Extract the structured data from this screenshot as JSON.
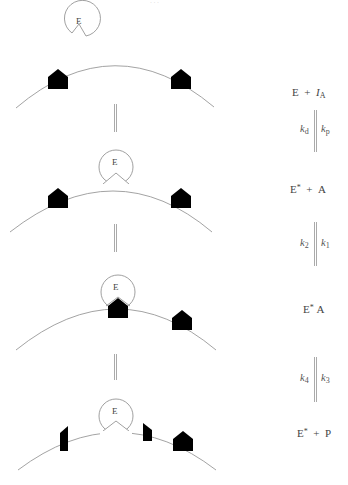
{
  "figure": {
    "type": "enzyme-mechanism-scheme",
    "header_clipped_text": "· · ·",
    "enzyme_label": "E",
    "colors": {
      "membrane": "#999999",
      "enzyme_outline": "#888888",
      "substrate_fill": "#000000",
      "arrow": "#aaaaaa",
      "text": "#444444"
    },
    "states": [
      {
        "id": "state-1",
        "equation": {
          "left": "E",
          "op": "+",
          "right_main": "I",
          "right_sub": "A"
        }
      },
      {
        "id": "state-2",
        "equation": {
          "left": "E",
          "left_sup": "*",
          "op": "+",
          "right_main": "A"
        }
      },
      {
        "id": "state-3",
        "equation": {
          "left": "E",
          "left_sup": "*",
          "right_main": "A"
        }
      },
      {
        "id": "state-4",
        "equation": {
          "left": "E",
          "left_sup": "*",
          "op": "+",
          "right_main": "P"
        }
      }
    ],
    "rate_constants": [
      {
        "left": "k",
        "left_sub": "d",
        "right": "k",
        "right_sub": "p"
      },
      {
        "left": "k",
        "left_sub": "2",
        "right": "k",
        "right_sub": "1"
      },
      {
        "left": "k",
        "left_sub": "4",
        "right": "k",
        "right_sub": "3"
      }
    ]
  }
}
